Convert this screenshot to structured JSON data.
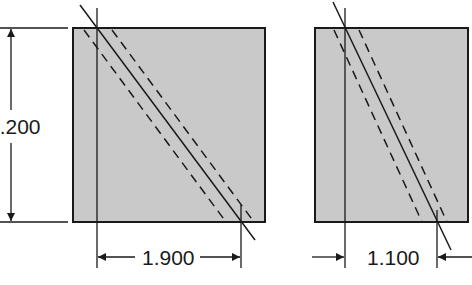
{
  "diagram": {
    "colors": {
      "fill": "#c9c9c9",
      "stroke": "#1a1a1a",
      "background": "#ffffff"
    },
    "left_panel": {
      "height_dimension": "2.200",
      "width_dimension": "1.900"
    },
    "right_panel": {
      "width_dimension": "1.100"
    }
  }
}
